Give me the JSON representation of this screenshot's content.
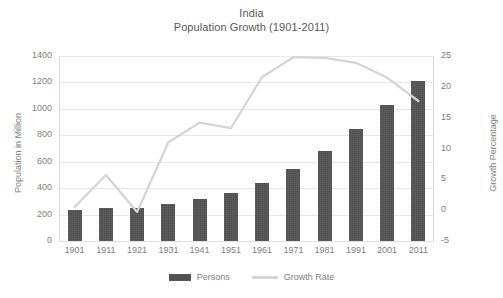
{
  "chart_data": {
    "type": "bar",
    "title": "India\nPopulation Growth (1901-2011)",
    "title_lines": [
      "India",
      "Population Growth (1901-2011)"
    ],
    "xlabel": "",
    "ylabel": "Population in Million",
    "y2label": "Growth Percentage",
    "categories": [
      "1901",
      "1911",
      "1921",
      "1931",
      "1941",
      "1951",
      "1961",
      "1971",
      "1981",
      "1991",
      "2001",
      "2011"
    ],
    "ylim": [
      0,
      1400
    ],
    "y2lim": [
      -5,
      25
    ],
    "yticks": [
      1400,
      1200,
      1000,
      800,
      600,
      400,
      200,
      0
    ],
    "y2ticks": [
      25,
      20,
      15,
      10,
      5,
      0,
      -5
    ],
    "grid": true,
    "legend_position": "bottom",
    "series": [
      {
        "name": "Persons",
        "kind": "bar",
        "axis": "left",
        "color": "#4d4d4d",
        "values": [
          238,
          252,
          251,
          279,
          319,
          361,
          439,
          548,
          683,
          846,
          1029,
          1211
        ]
      },
      {
        "name": "Growth Rate",
        "kind": "line",
        "axis": "right",
        "color": "#d4d4d4",
        "values": [
          0.5,
          5.7,
          -0.3,
          11.0,
          14.2,
          13.3,
          21.6,
          24.8,
          24.7,
          23.9,
          21.5,
          17.7
        ]
      }
    ]
  },
  "legend": {
    "items": [
      {
        "label": "Persons",
        "marker": "bar-swatch"
      },
      {
        "label": "Growth Rate",
        "marker": "line-swatch"
      }
    ]
  }
}
